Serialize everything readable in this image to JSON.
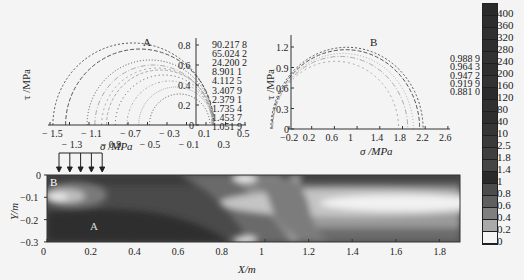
{
  "chart_data": [
    {
      "type": "line",
      "panel": "A",
      "title": "Mohr circles at point A",
      "xlabel": "σ /MPa",
      "ylabel": "τ /MPa",
      "xlim": [
        -1.5,
        0.5
      ],
      "ylim": [
        0,
        0.8
      ],
      "xticks_top_row": [
        "-1.5",
        "-1.1",
        "-0.7",
        "-0.3",
        "0.1",
        "0.5"
      ],
      "xticks_bottom_row": [
        "-1.3",
        "-0.9",
        "-0.5",
        "-0.1",
        "0.3"
      ],
      "yticks": [
        "0",
        "0.2",
        "0.4",
        "0.6",
        "0.8"
      ],
      "label": "A",
      "legend": [
        "90.217 8",
        "65.024 2",
        "24.200 2",
        "8.901 1",
        "4.112 5",
        "3.407 9",
        "2.379 1",
        "1.735 4",
        "1.453 7",
        "1.051 9"
      ],
      "series": [
        {
          "name": "90.217 8",
          "center": -0.65,
          "radius": 0.82
        },
        {
          "name": "65.024 2",
          "center": -0.58,
          "radius": 0.76
        },
        {
          "name": "24.200 2",
          "center": -0.47,
          "radius": 0.65
        },
        {
          "name": "8.901 1",
          "center": -0.44,
          "radius": 0.6
        },
        {
          "name": "4.112 5",
          "center": -0.4,
          "radius": 0.57
        },
        {
          "name": "3.407 9",
          "center": -0.37,
          "radius": 0.55
        },
        {
          "name": "2.379 1",
          "center": -0.33,
          "radius": 0.5
        },
        {
          "name": "1.735 4",
          "center": -0.27,
          "radius": 0.44
        },
        {
          "name": "1.453 7",
          "center": -0.21,
          "radius": 0.38
        },
        {
          "name": "1.051 9",
          "center": -0.17,
          "radius": 0.31
        }
      ]
    },
    {
      "type": "line",
      "panel": "B",
      "title": "Mohr circles at point B",
      "xlabel": "σ /MPa",
      "ylabel": "τ /MPa",
      "xlim": [
        -0.2,
        2.6
      ],
      "ylim": [
        0,
        1.35
      ],
      "xticks": [
        "-0.2",
        "0.2",
        "0.6",
        "1",
        "1.4",
        "1.8",
        "2.2",
        "2.6"
      ],
      "yticks": [
        "0",
        "0.3",
        "0.6",
        "0.9",
        "1.2"
      ],
      "label": "B",
      "legend": [
        "0.988 9",
        "0.964 3",
        "0.947 2",
        "0.919 9",
        "0.881 0"
      ],
      "series": [
        {
          "name": "0.988 9",
          "center": 1.32,
          "radius": 1.34
        },
        {
          "name": "0.964 3",
          "center": 1.3,
          "radius": 1.3
        },
        {
          "name": "0.947 2",
          "center": 1.25,
          "radius": 1.24
        },
        {
          "name": "0.919 9",
          "center": 1.2,
          "radius": 1.19
        },
        {
          "name": "0.881 0",
          "center": 1.12,
          "radius": 1.11
        }
      ]
    },
    {
      "type": "heatmap",
      "panel": "contour",
      "xlabel": "X/m",
      "ylabel": "Y/m",
      "xlim": [
        0,
        1.95
      ],
      "ylim": [
        -0.3,
        0
      ],
      "xticks": [
        "0",
        "0.2",
        "0.4",
        "0.6",
        "0.8",
        "1",
        "1.2",
        "1.4",
        "1.6",
        "1.8"
      ],
      "yticks": [
        "0",
        "-0.1",
        "-0.2",
        "-0.3"
      ],
      "annotations": [
        "A",
        "B"
      ],
      "load_arrows_x_range": [
        0.05,
        0.25
      ],
      "colorbar_levels": [
        "400",
        "360",
        "320",
        "280",
        "240",
        "200",
        "160",
        "120",
        "80",
        "40",
        "10",
        "2.5",
        "1.8",
        "1.4",
        "1",
        "0.8",
        "0.6",
        "0.4",
        "0.2",
        "0"
      ]
    }
  ],
  "labels": {
    "panel_a": "A",
    "panel_b": "B",
    "point_a": "A",
    "point_b": "B",
    "sigma_axis": "σ /MPa",
    "tau_axis": "τ /MPa",
    "x_axis": "X/m",
    "y_axis": "Y/m"
  }
}
